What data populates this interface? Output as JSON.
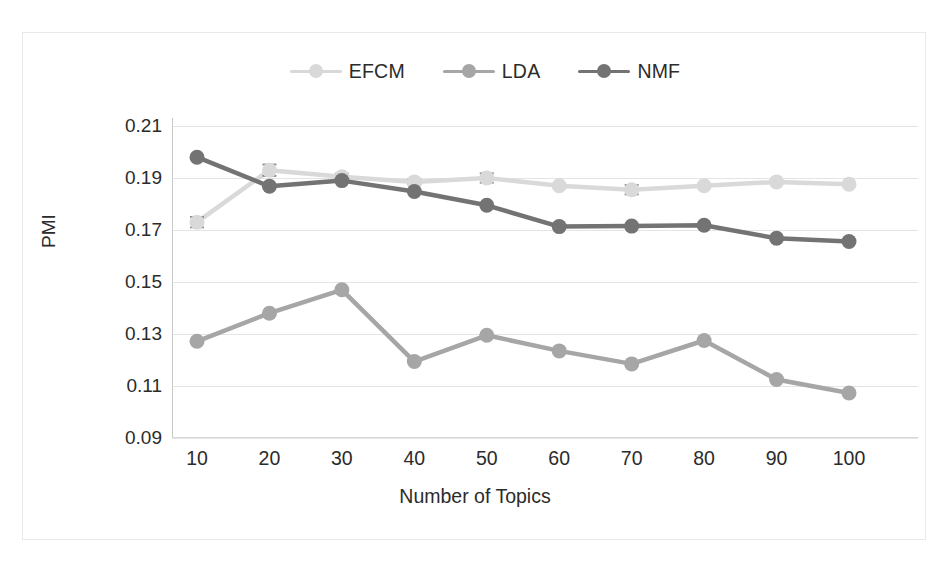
{
  "chart_data": {
    "type": "line",
    "title": "",
    "xlabel": "Number of Topics",
    "ylabel": "PMI",
    "x": [
      10,
      20,
      30,
      40,
      50,
      60,
      70,
      80,
      90,
      100
    ],
    "xticklabels": [
      "10",
      "20",
      "30",
      "40",
      "50",
      "60",
      "70",
      "80",
      "90",
      "100"
    ],
    "yticklabels": [
      "0.21",
      "0.19",
      "0.17",
      "0.15",
      "0.13",
      "0.11",
      "0.09"
    ],
    "yticks": [
      0.21,
      0.19,
      0.17,
      0.15,
      0.13,
      0.11,
      0.09
    ],
    "ylim": [
      0.09,
      0.21
    ],
    "xlim": [
      10,
      100
    ],
    "grid": "horizontal",
    "legend_position": "top-center",
    "series": [
      {
        "name": "EFCM",
        "color": "#d9d9d9",
        "values": [
          0.173,
          0.193,
          0.1905,
          0.1885,
          0.19,
          0.187,
          0.1855,
          0.187,
          0.1885,
          0.1876
        ],
        "errors": [
          0.002,
          0.0022,
          0.0012,
          0.001,
          0.0018,
          0.0,
          0.0018,
          0.0,
          0.0,
          0.0
        ]
      },
      {
        "name": "LDA",
        "color": "#a6a6a6",
        "values": [
          0.1272,
          0.138,
          0.147,
          0.1194,
          0.1295,
          0.1235,
          0.1185,
          0.1275,
          0.1125,
          0.1073
        ],
        "errors": [
          0,
          0,
          0,
          0,
          0,
          0,
          0,
          0,
          0,
          0
        ]
      },
      {
        "name": "NMF",
        "color": "#737373",
        "values": [
          0.198,
          0.1868,
          0.189,
          0.1848,
          0.1795,
          0.1713,
          0.1715,
          0.1718,
          0.1668,
          0.1656
        ],
        "errors": [
          0,
          0,
          0,
          0,
          0,
          0,
          0,
          0,
          0,
          0
        ]
      }
    ]
  },
  "legend": {
    "items": [
      {
        "label": "EFCM"
      },
      {
        "label": "LDA"
      },
      {
        "label": "NMF"
      }
    ]
  },
  "axes": {
    "y_title": "PMI",
    "x_title": "Number of Topics"
  }
}
